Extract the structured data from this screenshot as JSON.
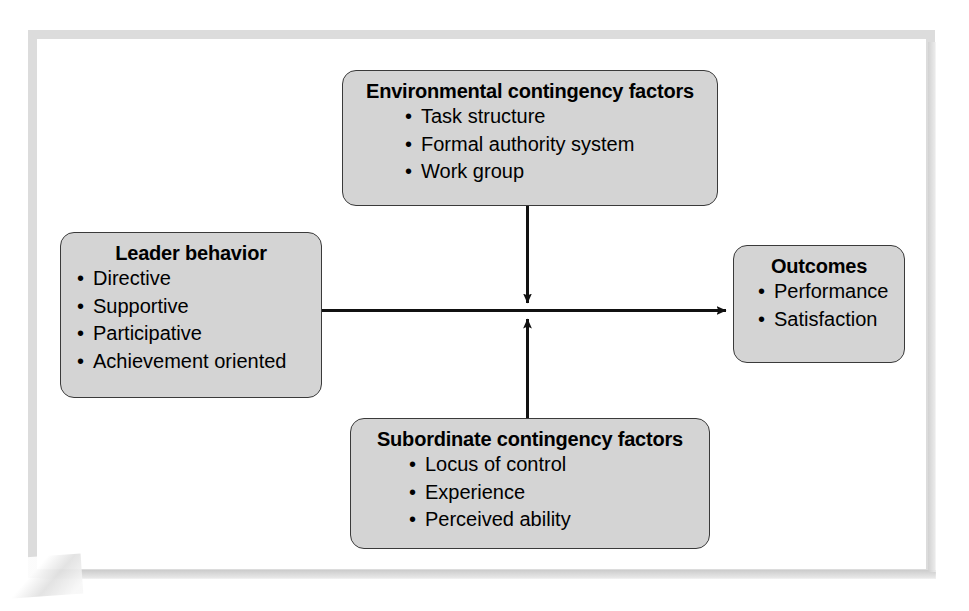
{
  "diagram": {
    "type": "flow-diagram",
    "accent_color": "#d4d4d4",
    "border_color": "#3a3a3a",
    "frame_color": "#dcdcdc",
    "boxes": {
      "environmental": {
        "title": "Environmental contingency factors",
        "items": [
          "Task structure",
          "Formal authority system",
          "Work group"
        ]
      },
      "leader": {
        "title": "Leader behavior",
        "items": [
          "Directive",
          "Supportive",
          "Participative",
          "Achievement oriented"
        ]
      },
      "outcomes": {
        "title": "Outcomes",
        "items": [
          "Performance",
          "Satisfaction"
        ]
      },
      "subordinate": {
        "title": "Subordinate contingency factors",
        "items": [
          "Locus of control",
          "Experience",
          "Perceived ability"
        ]
      }
    },
    "connectors": [
      {
        "name": "leader-to-outcomes",
        "from": "leader",
        "to": "outcomes",
        "direction": "right",
        "arrowhead": true
      },
      {
        "name": "environmental-to-path",
        "from": "environmental",
        "to": "leader-outcomes-path",
        "direction": "down",
        "arrowhead": true
      },
      {
        "name": "subordinate-to-path",
        "from": "subordinate",
        "to": "leader-outcomes-path",
        "direction": "up",
        "arrowhead": true
      }
    ]
  }
}
